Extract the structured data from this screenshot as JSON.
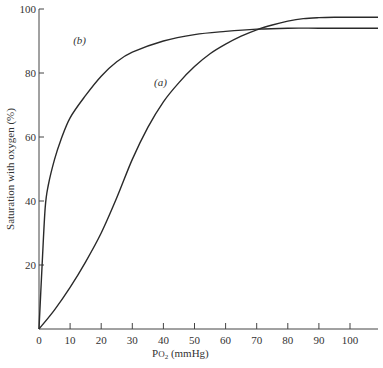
{
  "chart_data": {
    "type": "line",
    "title": "",
    "xlabel": "Po2 (mmHg)",
    "xlabel_main": "P",
    "xlabel_sub": "O",
    "xlabel_sub2": "2",
    "xlabel_unit": " (mmHg)",
    "ylabel": "Saturation with oxygen (%)",
    "xlim": [
      0,
      109
    ],
    "ylim": [
      0,
      100
    ],
    "x_ticks": [
      0,
      10,
      20,
      30,
      40,
      50,
      60,
      70,
      80,
      90,
      100
    ],
    "y_ticks": [
      20,
      40,
      60,
      80,
      100
    ],
    "grid": false,
    "series": [
      {
        "name": "(a)",
        "label": "(a)",
        "x": [
          0,
          5,
          10,
          15,
          20,
          25,
          30,
          35,
          40,
          45,
          50,
          55,
          60,
          65,
          70,
          75,
          80,
          85,
          90,
          95,
          100,
          109
        ],
        "values": [
          0,
          6,
          13,
          21,
          30,
          41,
          53,
          63,
          71,
          77,
          82,
          86,
          89,
          91.5,
          93.5,
          95,
          96.2,
          97,
          97.3,
          97.4,
          97.4,
          97.4
        ]
      },
      {
        "name": "(b)",
        "label": "(b)",
        "x": [
          0,
          1,
          2,
          3,
          5,
          7,
          10,
          15,
          20,
          25,
          30,
          40,
          50,
          60,
          70,
          80,
          90,
          100,
          109
        ],
        "values": [
          0,
          20,
          38,
          45,
          53,
          59,
          66,
          73,
          79,
          83.5,
          86.5,
          90,
          92,
          93,
          93.7,
          94,
          94,
          94,
          94
        ]
      }
    ],
    "annotations": [
      {
        "text": "(a)",
        "x": 37,
        "y": 76
      },
      {
        "text": "(b)",
        "x": 11,
        "y": 89
      }
    ]
  }
}
